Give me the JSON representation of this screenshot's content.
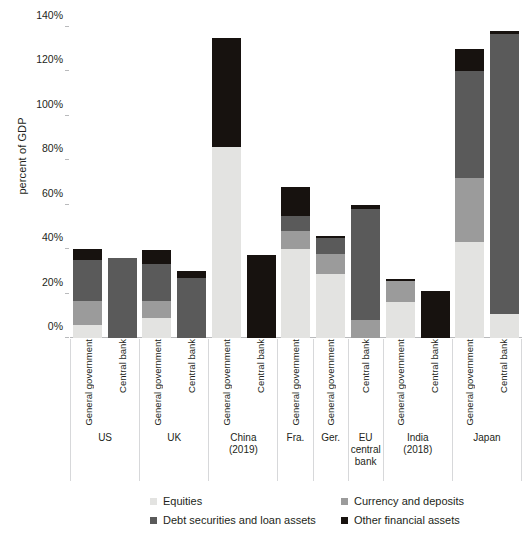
{
  "chart_data": {
    "type": "bar",
    "title": "",
    "subtitle": "",
    "xlabel": "",
    "ylabel": "percent of GDP",
    "ylim": [
      0,
      140
    ],
    "ytick_labels": [
      "0%",
      "20%",
      "40%",
      "60%",
      "80%",
      "100%",
      "120%",
      "140%"
    ],
    "ytick_values": [
      0,
      20,
      40,
      60,
      80,
      100,
      120,
      140
    ],
    "grid": false,
    "stacked": true,
    "legend_position": "bottom",
    "series": [
      {
        "name": "Equities",
        "color": "#e3e3e1",
        "key": "equities"
      },
      {
        "name": "Currency and deposits",
        "color": "#9b9b9b",
        "key": "currency_deposits"
      },
      {
        "name": "Debt securities and loan assets",
        "color": "#5a5a5a",
        "key": "debt_loans"
      },
      {
        "name": "Other financial assets",
        "color": "#17120f",
        "key": "other_financial"
      }
    ],
    "categories": [
      "US",
      "UK",
      "China (2019)",
      "Fra.",
      "Ger.",
      "EU central bank",
      "India (2018)",
      "Japan"
    ],
    "groups": [
      {
        "label": "US",
        "label_lines": [
          "US"
        ],
        "bars": [
          {
            "label": "General government",
            "equities": 6,
            "currency_deposits": 10.5,
            "debt_loans": 18.5,
            "other_financial": 5,
            "total": 40
          },
          {
            "label": "Central bank",
            "equities": 0,
            "currency_deposits": 0,
            "debt_loans": 36,
            "other_financial": 0,
            "total": 36
          }
        ]
      },
      {
        "label": "UK",
        "label_lines": [
          "UK"
        ],
        "bars": [
          {
            "label": "General government",
            "equities": 9,
            "currency_deposits": 7.5,
            "debt_loans": 17,
            "other_financial": 6,
            "total": 39.5
          },
          {
            "label": "Central bank",
            "equities": 0,
            "currency_deposits": 0,
            "debt_loans": 27,
            "other_financial": 3,
            "total": 30
          }
        ]
      },
      {
        "label": "China (2019)",
        "label_lines": [
          "China",
          "(2019)"
        ],
        "bars": [
          {
            "label": "General government",
            "equities": 86,
            "currency_deposits": 0,
            "debt_loans": 0,
            "other_financial": 49,
            "total": 135
          },
          {
            "label": "Central bank",
            "equities": 0,
            "currency_deposits": 0,
            "debt_loans": 0,
            "other_financial": 37.5,
            "total": 37.5
          }
        ]
      },
      {
        "label": "Fra.",
        "label_lines": [
          "Fra."
        ],
        "bars": [
          {
            "label": "General government",
            "equities": 40,
            "currency_deposits": 8,
            "debt_loans": 7,
            "other_financial": 13,
            "total": 68
          }
        ]
      },
      {
        "label": "Ger.",
        "label_lines": [
          "Ger."
        ],
        "bars": [
          {
            "label": "General government",
            "equities": 29,
            "currency_deposits": 9,
            "debt_loans": 7,
            "other_financial": 1,
            "total": 46
          }
        ]
      },
      {
        "label": "EU central bank",
        "label_lines": [
          "EU",
          "central",
          "bank"
        ],
        "bars": [
          {
            "label": "Central bank",
            "equities": 0,
            "currency_deposits": 8,
            "debt_loans": 50,
            "other_financial": 2,
            "total": 60
          }
        ]
      },
      {
        "label": "India (2018)",
        "label_lines": [
          "India",
          "(2018)"
        ],
        "bars": [
          {
            "label": "General government",
            "equities": 16,
            "currency_deposits": 9.5,
            "debt_loans": 0,
            "other_financial": 1,
            "total": 26.5
          },
          {
            "label": "Central bank",
            "equities": 0,
            "currency_deposits": 0,
            "debt_loans": 0,
            "other_financial": 21,
            "total": 21
          }
        ]
      },
      {
        "label": "Japan",
        "label_lines": [
          "Japan"
        ],
        "bars": [
          {
            "label": "General government",
            "equities": 43,
            "currency_deposits": 29,
            "debt_loans": 48,
            "other_financial": 10,
            "total": 130
          },
          {
            "label": "Central bank",
            "equities": 11,
            "currency_deposits": 0,
            "debt_loans": 126,
            "other_financial": 1,
            "total": 138
          }
        ]
      }
    ]
  },
  "legend": {
    "items": [
      {
        "label": "Equities",
        "color": "#e3e3e1"
      },
      {
        "label": "Currency and deposits",
        "color": "#9b9b9b"
      },
      {
        "label": "Debt securities and loan assets",
        "color": "#5a5a5a"
      },
      {
        "label": "Other financial assets",
        "color": "#17120f"
      }
    ]
  }
}
